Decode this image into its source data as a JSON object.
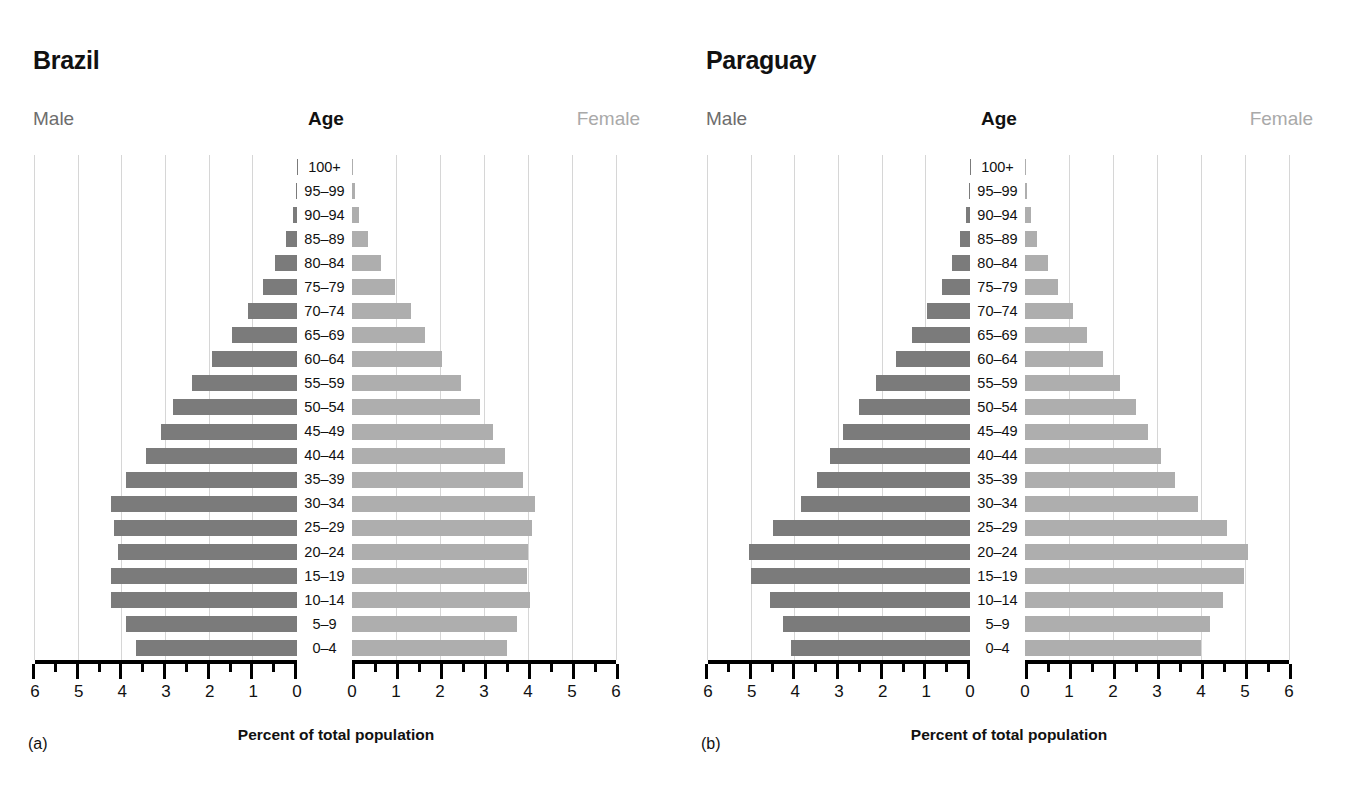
{
  "figure": {
    "xlabel": "Percent of total population",
    "header_male": "Male",
    "header_age": "Age",
    "header_female": "Female",
    "tick_labels_left": [
      "6",
      "5",
      "4",
      "3",
      "2",
      "1",
      "0"
    ],
    "tick_labels_right": [
      "0",
      "1",
      "2",
      "3",
      "4",
      "5",
      "6"
    ],
    "age_groups": [
      "100+",
      "95–99",
      "90–94",
      "85–89",
      "80–84",
      "75–79",
      "70–74",
      "65–69",
      "60–64",
      "55–59",
      "50–54",
      "45–49",
      "40–44",
      "35–39",
      "30–34",
      "25–29",
      "20–24",
      "15–19",
      "10–14",
      "5–9",
      "0–4"
    ],
    "colors": {
      "male_bar": "#7b7b7b",
      "female_bar": "#aeaeae",
      "grid": "#d6d6d6",
      "axis": "#000000",
      "male_label": "#6d6d6d",
      "female_label": "#a9a9a9"
    }
  },
  "panels": [
    {
      "letter": "(a)",
      "title": "Brazil"
    },
    {
      "letter": "(b)",
      "title": "Paraguay"
    }
  ],
  "chart_data": [
    {
      "type": "bar",
      "title": "Brazil",
      "subtitle": "(a)",
      "orientation": "population-pyramid",
      "xlabel": "Percent of total population",
      "ylabel": "Age",
      "xlim": [
        0,
        6
      ],
      "xticks": [
        0,
        1,
        2,
        3,
        4,
        5,
        6
      ],
      "grid": true,
      "legend": [
        "Male",
        "Female"
      ],
      "legend_position": "top-left and top-right",
      "categories": [
        "100+",
        "95–99",
        "90–94",
        "85–89",
        "80–84",
        "75–79",
        "70–74",
        "65–69",
        "60–64",
        "55–59",
        "50–54",
        "45–49",
        "40–44",
        "35–39",
        "30–34",
        "25–29",
        "20–24",
        "15–19",
        "10–14",
        "5–9",
        "0–4"
      ],
      "series": [
        {
          "name": "Male",
          "values": [
            0.01,
            0.03,
            0.1,
            0.26,
            0.5,
            0.78,
            1.13,
            1.5,
            1.95,
            2.4,
            2.85,
            3.12,
            3.45,
            3.92,
            4.26,
            4.2,
            4.1,
            4.26,
            4.26,
            3.92,
            3.68
          ]
        },
        {
          "name": "Female",
          "values": [
            0.02,
            0.06,
            0.16,
            0.37,
            0.66,
            0.98,
            1.33,
            1.66,
            2.05,
            2.48,
            2.92,
            3.2,
            3.48,
            3.88,
            4.15,
            4.08,
            4.0,
            3.98,
            4.05,
            3.76,
            3.52
          ]
        }
      ]
    },
    {
      "type": "bar",
      "title": "Paraguay",
      "subtitle": "(b)",
      "orientation": "population-pyramid",
      "xlabel": "Percent of total population",
      "ylabel": "Age",
      "xlim": [
        0,
        6
      ],
      "xticks": [
        0,
        1,
        2,
        3,
        4,
        5,
        6
      ],
      "grid": true,
      "legend": [
        "Male",
        "Female"
      ],
      "legend_position": "top-left and top-right",
      "categories": [
        "100+",
        "95–99",
        "90–94",
        "85–89",
        "80–84",
        "75–79",
        "70–74",
        "65–69",
        "60–64",
        "55–59",
        "50–54",
        "45–49",
        "40–44",
        "35–39",
        "30–34",
        "25–29",
        "20–24",
        "15–19",
        "10–14",
        "5–9",
        "0–4"
      ],
      "series": [
        {
          "name": "Male",
          "values": [
            0.01,
            0.03,
            0.09,
            0.22,
            0.42,
            0.65,
            0.98,
            1.32,
            1.7,
            2.15,
            2.55,
            2.9,
            3.2,
            3.5,
            3.88,
            4.52,
            5.05,
            5.02,
            4.59,
            4.29,
            4.09
          ]
        },
        {
          "name": "Female",
          "values": [
            0.02,
            0.05,
            0.13,
            0.28,
            0.52,
            0.75,
            1.1,
            1.42,
            1.78,
            2.15,
            2.52,
            2.8,
            3.08,
            3.4,
            3.93,
            4.6,
            5.07,
            4.98,
            4.5,
            4.2,
            4.0
          ]
        }
      ]
    }
  ]
}
